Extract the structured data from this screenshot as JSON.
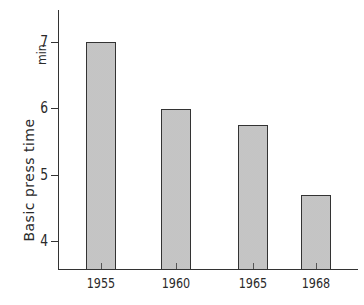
{
  "chart_data": {
    "type": "bar",
    "title": "",
    "xlabel": "",
    "ylabel": "Basic press time",
    "yunit": "min",
    "categories": [
      "1955",
      "1960",
      "1965",
      "1968"
    ],
    "values": [
      7.0,
      6.0,
      5.75,
      4.7
    ],
    "ylim": [
      3.58,
      8.0
    ],
    "yticks": [
      4,
      5,
      6,
      7
    ],
    "ytick_labels": [
      "4",
      "5",
      "6",
      "7"
    ],
    "grid": false,
    "legend": null,
    "bar_fill": "#dcdcdc",
    "bar_edge": "#333333"
  }
}
